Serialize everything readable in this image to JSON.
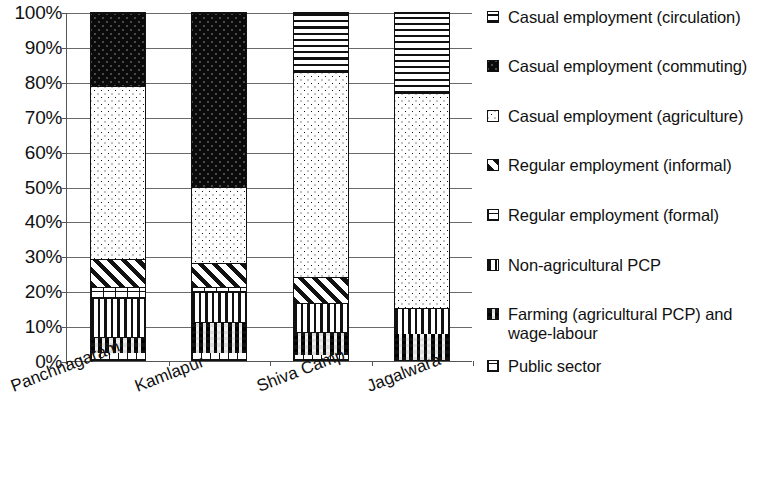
{
  "chart_data": {
    "type": "bar",
    "subtype": "stacked-percentage",
    "title": "",
    "xlabel": "",
    "ylabel": "",
    "ylim": [
      0,
      100
    ],
    "y_tick_labels": [
      "100%",
      "90%",
      "80%",
      "70%",
      "60%",
      "50%",
      "40%",
      "30%",
      "20%",
      "10%",
      "0%"
    ],
    "y_tick_values": [
      100,
      90,
      80,
      70,
      60,
      50,
      40,
      30,
      20,
      10,
      0
    ],
    "grid": true,
    "legend_position": "right",
    "categories": [
      "Panchnagaram",
      "Kamlapur",
      "Shiva Camp",
      "Jagalwara"
    ],
    "series": [
      {
        "name": "Public sector",
        "pattern": "grid-fine",
        "values": [
          2,
          2,
          1.5,
          0
        ]
      },
      {
        "name": "Farming (agricultural PCP) and wage-labour",
        "pattern": "checkerboard",
        "values": [
          4.5,
          9,
          6.5,
          7.5
        ]
      },
      {
        "name": "Non-agricultural PCP",
        "pattern": "vertical-lines",
        "values": [
          11.5,
          8.5,
          8.5,
          7.5
        ]
      },
      {
        "name": "Regular employment (formal)",
        "pattern": "brick",
        "values": [
          3,
          1.5,
          0,
          0
        ]
      },
      {
        "name": "Regular employment (informal)",
        "pattern": "diagonal-stripes",
        "values": [
          8,
          7,
          7.5,
          0
        ]
      },
      {
        "name": "Casual employment (agriculture)",
        "pattern": "light-dots",
        "values": [
          50,
          22,
          59,
          62
        ]
      },
      {
        "name": "Casual employment (commuting)",
        "pattern": "solid-black-dots",
        "values": [
          21,
          50,
          0,
          0
        ]
      },
      {
        "name": "Casual employment (circulation)",
        "pattern": "horizontal-lines",
        "values": [
          0,
          0,
          17,
          23
        ]
      }
    ]
  },
  "legend": {
    "items": [
      {
        "label": "Casual employment (circulation)",
        "pattern": "horizontal-lines"
      },
      {
        "label": "Casual employment (commuting)",
        "pattern": "solid-black-dots"
      },
      {
        "label": "Casual employment (agriculture)",
        "pattern": "light-dots"
      },
      {
        "label": "Regular employment (informal)",
        "pattern": "diagonal-stripes"
      },
      {
        "label": "Regular employment (formal)",
        "pattern": "brick"
      },
      {
        "label": "Non-agricultural PCP",
        "pattern": "vertical-lines"
      },
      {
        "label": "Farming (agricultural PCP) and\nwage-labour",
        "pattern": "checkerboard"
      },
      {
        "label": "Public sector",
        "pattern": "grid-fine"
      }
    ]
  }
}
